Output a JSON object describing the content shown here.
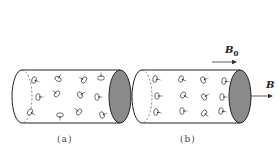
{
  "figure": {
    "panels": [
      {
        "id": "a",
        "caption": "(a)",
        "description": "Unmagnetized material: atomic current loops (magnetic moments) randomly oriented inside cylinder",
        "dipole_angles_deg": [
          200,
          120,
          30,
          90,
          180,
          40,
          150,
          180,
          210,
          -90,
          40,
          160
        ]
      },
      {
        "id": "b",
        "caption": "(b)",
        "description": "Magnetized material in external field B0: magnetic moments largely aligned along the field",
        "dipole_angles_deg": [
          10,
          20,
          -20,
          10,
          0,
          30,
          -30,
          0,
          10,
          0,
          40,
          10
        ],
        "external_field_label": "B",
        "external_field_subscript": "0",
        "resultant_field_label": "B"
      }
    ],
    "colors": {
      "outline": "#222222",
      "end_cap_fill": "#8a8a8a",
      "arrow": "#333333"
    }
  }
}
